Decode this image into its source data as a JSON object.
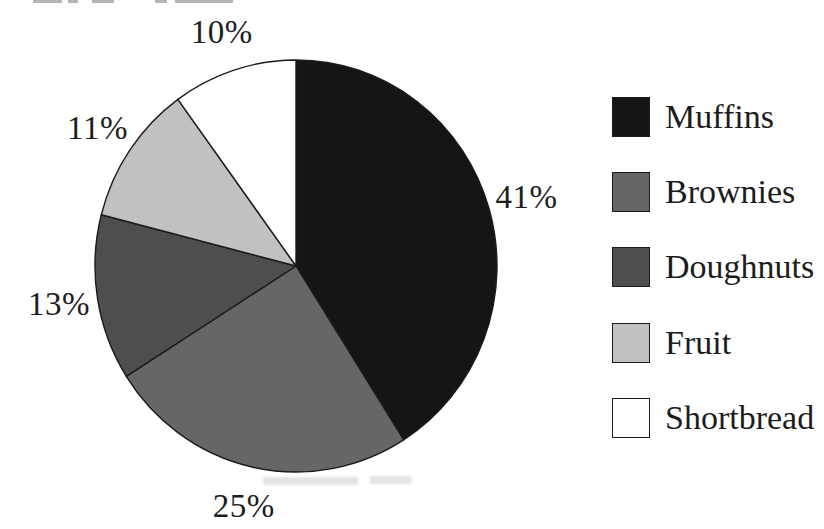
{
  "chart_data": {
    "type": "pie",
    "title": "",
    "categories": [
      "Muffins",
      "Brownies",
      "Doughnuts",
      "Fruit",
      "Shortbread"
    ],
    "values": [
      41,
      25,
      13,
      11,
      10
    ],
    "unit": "%",
    "slice_labels": [
      "41%",
      "25%",
      "13%",
      "11%",
      "10%"
    ],
    "colors": [
      "#151515",
      "#666666",
      "#4e4e4e",
      "#c1c1c1",
      "#ffffff"
    ],
    "outline_color": "#1b1b1b",
    "start_angle_deg": 0,
    "direction": "clockwise",
    "legend_position": "right",
    "grid": false
  }
}
